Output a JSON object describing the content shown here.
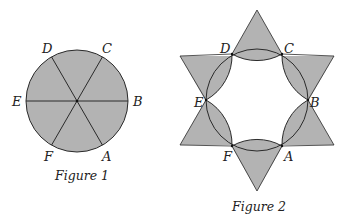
{
  "figure1": {
    "caption": "Figure 1",
    "labels": {
      "A": "A",
      "B": "B",
      "C": "C",
      "D": "D",
      "E": "E",
      "F": "F"
    },
    "description": "Shaded circle divided into six equal sectors by three diameters AD, BE, CF"
  },
  "figure2": {
    "caption": "Figure 2",
    "labels": {
      "A": "A",
      "B": "B",
      "C": "C",
      "D": "D",
      "E": "E",
      "F": "F"
    },
    "description": "Six-pointed star (two overlapping equilateral triangles) with hexagon vertices A-F; lens shapes between adjacent vertices formed by circle arcs and reflected arcs; shaded regions are triangle points and lenses"
  },
  "colors": {
    "fill": "#b3b3b3",
    "stroke": "#2a2a2a",
    "background": "#ffffff"
  }
}
